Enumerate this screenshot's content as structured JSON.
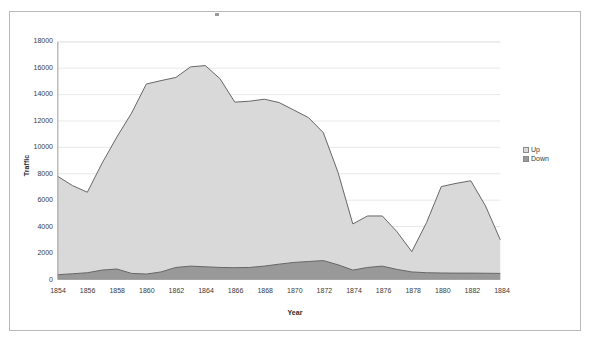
{
  "chart_data": {
    "type": "area",
    "stacked": true,
    "title": "",
    "xlabel": "Year",
    "ylabel": "Traffic",
    "x": [
      1854,
      1855,
      1856,
      1857,
      1858,
      1859,
      1860,
      1861,
      1862,
      1863,
      1864,
      1865,
      1866,
      1867,
      1868,
      1869,
      1870,
      1871,
      1872,
      1873,
      1874,
      1875,
      1876,
      1877,
      1878,
      1879,
      1880,
      1881,
      1882,
      1883,
      1884
    ],
    "xtick_labels": [
      "1854",
      "1856",
      "1858",
      "1860",
      "1862",
      "1864",
      "1866",
      "1868",
      "1870",
      "1872",
      "1874",
      "1876",
      "1878",
      "1880",
      "1882",
      "1884"
    ],
    "ytick_labels": [
      "0",
      "2000",
      "4000",
      "6000",
      "8000",
      "10000",
      "12000",
      "14000",
      "16000",
      "18000"
    ],
    "ylim": [
      0,
      18000
    ],
    "xlim": [
      1854,
      1884
    ],
    "ytick_step": 2000,
    "grid": true,
    "legend_position": "right",
    "series": [
      {
        "name": "Down",
        "color": "#999999",
        "values": [
          350,
          420,
          500,
          700,
          780,
          450,
          400,
          560,
          900,
          1000,
          950,
          900,
          880,
          900,
          1000,
          1150,
          1280,
          1350,
          1420,
          1100,
          700,
          900,
          1000,
          750,
          560,
          500,
          480,
          470,
          470,
          460,
          450
        ]
      },
      {
        "name": "Up",
        "color": "#d9d9d9",
        "values": [
          7450,
          6680,
          6100,
          8100,
          10000,
          12150,
          14400,
          14500,
          14400,
          15100,
          15250,
          14300,
          12550,
          12600,
          12650,
          12250,
          11550,
          10900,
          9700,
          7000,
          3500,
          3900,
          3800,
          2850,
          1540,
          3800,
          6550,
          6800,
          7000,
          5100,
          2550
        ]
      }
    ],
    "totals": [
      7800,
      7100,
      6600,
      8800,
      10780,
      12600,
      14800,
      15060,
      15300,
      16100,
      16200,
      15200,
      13430,
      13500,
      13650,
      13400,
      12830,
      12250,
      11120,
      8100,
      4200,
      4800,
      4800,
      3600,
      2100,
      4300,
      7030,
      7270,
      7470,
      5560,
      3000
    ]
  },
  "legend": {
    "items": [
      {
        "label": "Up"
      },
      {
        "label": "Down"
      }
    ]
  },
  "colors": {
    "up_fill": "#d9d9d9",
    "down_fill": "#999999",
    "line": "#666666",
    "grid": "#e8e8e8",
    "axis": "#9a9a9a",
    "frame": "#b9b9b9",
    "text": "#3a3a3a"
  }
}
